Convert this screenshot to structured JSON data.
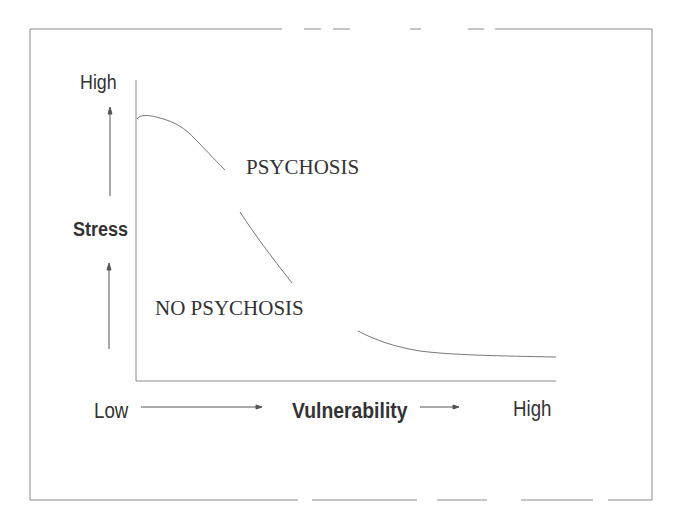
{
  "diagram": {
    "y_axis": {
      "label": "Stress",
      "high_label": "High"
    },
    "x_axis": {
      "label": "Vulnerability",
      "low_label": "Low",
      "high_label": "High"
    },
    "regions": {
      "above_curve": "PSYCHOSIS",
      "below_curve": "NO PSYCHOSIS"
    },
    "curve": {
      "description": "Threshold curve decreasing from high stress at low vulnerability to low stress at high vulnerability",
      "color": "#777777"
    },
    "colors": {
      "line": "#888888",
      "text": "#333333",
      "background": "#ffffff"
    }
  }
}
